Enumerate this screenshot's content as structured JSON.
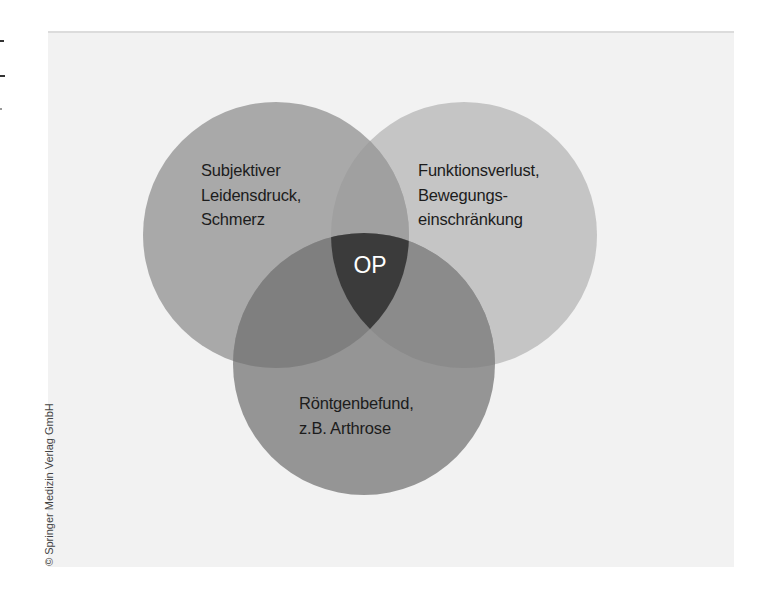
{
  "diagram": {
    "type": "venn",
    "sets": [
      {
        "id": "left",
        "label": "Subjektiver\nLeidensdruck,\nSchmerz",
        "color": "#a9a9a9",
        "cx": 276,
        "cy": 235,
        "r": 133
      },
      {
        "id": "right",
        "label": "Funktionsverlust,\nBewegungs-\neinschränkung",
        "color": "#c5c5c5",
        "cx": 464,
        "cy": 235,
        "r": 133
      },
      {
        "id": "bottom",
        "label": "Röntgenbefund,\nz.B. Arthrose",
        "color": "#959595",
        "cx": 364,
        "cy": 364,
        "r": 131
      }
    ],
    "overlaps": {
      "left_right": "#a0a0a0",
      "left_bottom": "#7f7f7f",
      "right_bottom": "#8b8b8b",
      "all": "#3b3b3b"
    },
    "center_label": "OP",
    "center_label_color": "#ffffff",
    "background": "#f2f2f2"
  },
  "copyright": "© Springer Medizin Verlag GmbH"
}
